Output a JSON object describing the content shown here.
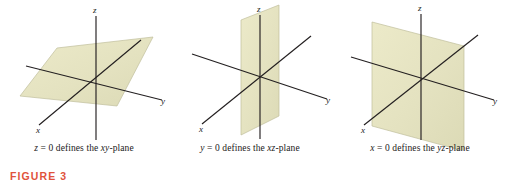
{
  "figure": {
    "label": "FIGURE 3",
    "label_color": "#e0533c",
    "background_color": "#ffffff",
    "plane_fill_color": "#e4e2c2",
    "plane_edge_color": "#b8b694",
    "axis_color": "#231f20"
  },
  "panels": [
    {
      "id": "xy-plane-panel",
      "caption_prefix": "z",
      "caption_mid": " = 0 defines the ",
      "caption_plane": "xy",
      "caption_suffix": "-plane",
      "caption_full": "z = 0 defines the xy-plane",
      "axes": {
        "z_label": "z",
        "y_label": "y",
        "x_label": "x"
      }
    },
    {
      "id": "xz-plane-panel",
      "caption_prefix": "y",
      "caption_mid": " = 0 defines the ",
      "caption_plane": "xz",
      "caption_suffix": "-plane",
      "caption_full": "y = 0 defines the xz-plane",
      "axes": {
        "z_label": "z",
        "y_label": "y",
        "x_label": "x"
      }
    },
    {
      "id": "yz-plane-panel",
      "caption_prefix": "x",
      "caption_mid": " = 0 defines the ",
      "caption_plane": "yz",
      "caption_suffix": "-plane",
      "caption_full": "x = 0 defines the yz-plane",
      "axes": {
        "z_label": "z",
        "y_label": "y",
        "x_label": "x"
      }
    }
  ]
}
